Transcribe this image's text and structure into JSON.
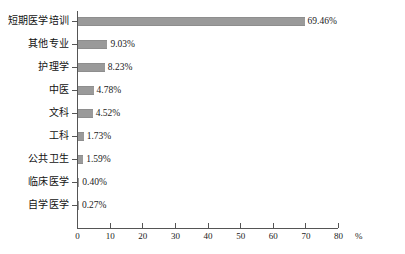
{
  "chart_data": {
    "type": "bar",
    "orientation": "horizontal",
    "title": "",
    "xlabel": "%",
    "ylabel": "",
    "xlim": [
      0,
      80
    ],
    "xticks": [
      0,
      10,
      20,
      30,
      40,
      50,
      60,
      70,
      80
    ],
    "xtick_labels": [
      "0",
      "10",
      "20",
      "30",
      "40",
      "50",
      "60",
      "70",
      "80"
    ],
    "grid": false,
    "legend": false,
    "bar_color": "#9a9a9a",
    "axis_color": "#555555",
    "categories": [
      "短期医学培训",
      "其他专业",
      "护理学",
      "中医",
      "文科",
      "工科",
      "公共卫生",
      "临床医学",
      "自学医学"
    ],
    "values": [
      69.46,
      9.03,
      8.23,
      4.78,
      4.52,
      1.73,
      1.59,
      0.4,
      0.27
    ],
    "value_labels": [
      "69.46%",
      "9.03%",
      "8.23%",
      "4.78%",
      "4.52%",
      "1.73%",
      "1.59%",
      "0.40%",
      "0.27%"
    ]
  },
  "axis": {
    "unit_label": "%"
  }
}
